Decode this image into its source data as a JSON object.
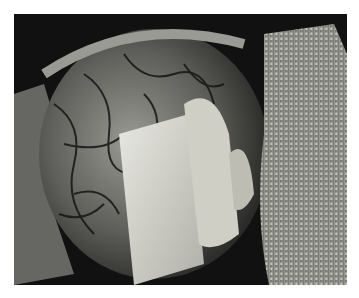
{
  "image": {
    "kind": "photograph",
    "subject": "intraoperative surgical field",
    "colors": {
      "background": "#ffffff",
      "drape_dark": "#0c0c0c",
      "tissue_light": "#d8d8d0",
      "gauze": "#b8b8b0",
      "vessel": "#1a1a1a"
    }
  }
}
